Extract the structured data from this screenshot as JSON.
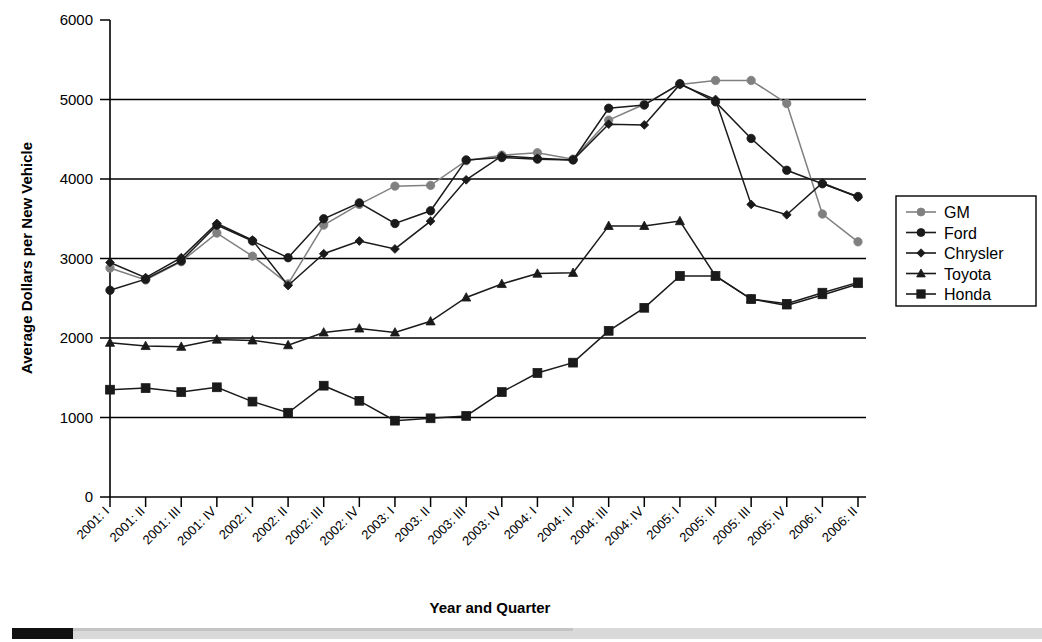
{
  "chart_data": {
    "type": "line",
    "title": "",
    "xlabel": "Year and Quarter",
    "ylabel": "Average Dollars per New Vehicle",
    "ylim": [
      0,
      6000
    ],
    "yticks": [
      0,
      1000,
      2000,
      3000,
      4000,
      5000,
      6000
    ],
    "ytick_labels": [
      "0",
      "1000",
      "2000",
      "3000",
      "4000",
      "5000",
      "6000"
    ],
    "grid": "horizontal",
    "legend_position": "right",
    "categories": [
      "2001: I",
      "2001: II",
      "2001: III",
      "2001: IV",
      "2002: I",
      "2002: II",
      "2002: III",
      "2002: IV",
      "2003: I",
      "2003: II",
      "2003: III",
      "2003: IV",
      "2004: I",
      "2004: II",
      "2004: III",
      "2004: IV",
      "2005: I",
      "2005: II",
      "2005: III",
      "2005: IV",
      "2006: I",
      "2006: II"
    ],
    "series": [
      {
        "name": "GM",
        "color": "#808080",
        "marker": "circle",
        "values": [
          2880,
          2730,
          2960,
          3320,
          3030,
          2680,
          3420,
          3680,
          3910,
          3920,
          4230,
          4300,
          4330,
          4250,
          4740,
          4940,
          5190,
          5240,
          5240,
          4950,
          3560,
          3210
        ]
      },
      {
        "name": "Ford",
        "color": "#1a1a1a",
        "marker": "circle",
        "values": [
          2600,
          2740,
          2970,
          3420,
          3220,
          3010,
          3500,
          3700,
          3440,
          3600,
          4240,
          4270,
          4250,
          4240,
          4890,
          4930,
          5200,
          4970,
          4510,
          4110,
          3940,
          3780
        ]
      },
      {
        "name": "Chrysler",
        "color": "#1a1a1a",
        "marker": "diamond",
        "values": [
          2950,
          2760,
          3010,
          3440,
          3230,
          2660,
          3060,
          3220,
          3120,
          3470,
          3990,
          4290,
          4260,
          4240,
          4690,
          4680,
          5190,
          5000,
          3680,
          3550,
          3950,
          3770
        ]
      },
      {
        "name": "Toyota",
        "color": "#1a1a1a",
        "marker": "triangle",
        "values": [
          1940,
          1900,
          1890,
          1980,
          1970,
          1910,
          2070,
          2120,
          2070,
          2210,
          2510,
          2680,
          2810,
          2820,
          3410,
          3410,
          3470,
          2780,
          2490,
          2410,
          2540,
          2680
        ]
      },
      {
        "name": "Honda",
        "color": "#1a1a1a",
        "marker": "square",
        "values": [
          1350,
          1370,
          1320,
          1380,
          1200,
          1060,
          1400,
          1210,
          960,
          990,
          1020,
          1320,
          1560,
          1690,
          2090,
          2380,
          2780,
          2780,
          2490,
          2430,
          2570,
          2700
        ]
      }
    ]
  },
  "legend": {
    "items": [
      {
        "label": "GM"
      },
      {
        "label": "Ford"
      },
      {
        "label": "Chrysler"
      },
      {
        "label": "Toyota"
      },
      {
        "label": "Honda"
      }
    ]
  }
}
